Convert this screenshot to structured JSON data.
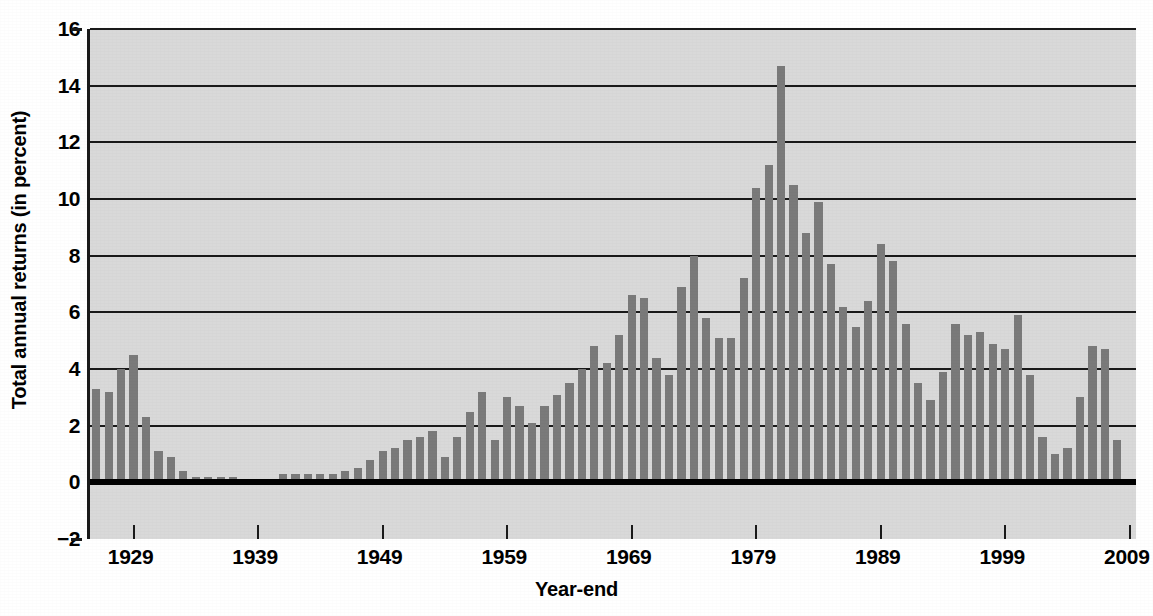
{
  "chart_data": {
    "type": "bar",
    "title": "",
    "subtitle": "",
    "xlabel": "Year-end",
    "ylabel": "Total annual returns (in percent)",
    "ylim": [
      -2,
      16
    ],
    "xlim": [
      1925.5,
      2009.5
    ],
    "grid": true,
    "legend_position": "none",
    "bar_color": "#7a7a7a",
    "plot_background": "#d9d9d9",
    "axis_color": "#1a1a1a",
    "y_ticks": [
      -2,
      0,
      2,
      4,
      6,
      8,
      10,
      12,
      14,
      16
    ],
    "y_tick_labels": [
      "−2",
      "0",
      "2",
      "4",
      "6",
      "8",
      "10",
      "12",
      "14",
      "16"
    ],
    "x_ticks": [
      1929,
      1939,
      1949,
      1959,
      1969,
      1979,
      1989,
      1999,
      2009
    ],
    "x_tick_labels": [
      "1929",
      "1939",
      "1949",
      "1959",
      "1969",
      "1979",
      "1989",
      "1999",
      "2009"
    ],
    "categories": [
      1926,
      1927,
      1928,
      1929,
      1930,
      1931,
      1932,
      1933,
      1934,
      1935,
      1936,
      1937,
      1938,
      1939,
      1940,
      1941,
      1942,
      1943,
      1944,
      1945,
      1946,
      1947,
      1948,
      1949,
      1950,
      1951,
      1952,
      1953,
      1954,
      1955,
      1956,
      1957,
      1958,
      1959,
      1960,
      1961,
      1962,
      1963,
      1964,
      1965,
      1966,
      1967,
      1968,
      1969,
      1970,
      1971,
      1972,
      1973,
      1974,
      1975,
      1976,
      1977,
      1978,
      1979,
      1980,
      1981,
      1982,
      1983,
      1984,
      1985,
      1986,
      1987,
      1988,
      1989,
      1990,
      1991,
      1992,
      1993,
      1994,
      1995,
      1996,
      1997,
      1998,
      1999,
      2000,
      2001,
      2002,
      2003,
      2004,
      2005,
      2006,
      2007,
      2008,
      2009
    ],
    "values": [
      3.3,
      3.2,
      4.0,
      4.5,
      2.3,
      1.1,
      0.9,
      0.4,
      0.2,
      0.2,
      0.2,
      0.2,
      0.0,
      0.0,
      0.0,
      0.3,
      0.3,
      0.3,
      0.3,
      0.3,
      0.4,
      0.5,
      0.8,
      1.1,
      1.2,
      1.5,
      1.6,
      1.8,
      0.9,
      1.6,
      2.5,
      3.2,
      1.5,
      3.0,
      2.7,
      2.1,
      2.7,
      3.1,
      3.5,
      4.0,
      4.8,
      4.2,
      5.2,
      6.6,
      6.5,
      4.4,
      3.8,
      6.9,
      8.0,
      5.8,
      5.1,
      5.1,
      7.2,
      10.4,
      11.2,
      14.7,
      10.5,
      8.8,
      9.9,
      7.7,
      6.2,
      5.5,
      6.4,
      8.4,
      7.8,
      5.6,
      3.5,
      2.9,
      3.9,
      5.6,
      5.2,
      5.3,
      4.9,
      4.7,
      5.9,
      3.8,
      1.6,
      1.0,
      1.2,
      3.0,
      4.8,
      4.7,
      1.5,
      0.1
    ]
  },
  "axis": {
    "y_title": "Total annual returns (in percent)",
    "x_title": "Year-end"
  }
}
